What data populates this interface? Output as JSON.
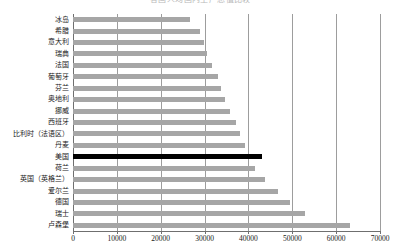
{
  "chart_data": {
    "type": "bar",
    "orientation": "horizontal",
    "title": "各国人均国内生产总值比较",
    "xlabel": "",
    "ylabel": "",
    "xlim": [
      0,
      70000
    ],
    "xticks": [
      0,
      10000,
      20000,
      30000,
      40000,
      50000,
      60000,
      70000
    ],
    "xtick_labels": [
      "0",
      "10000",
      "20000",
      "30000",
      "40000",
      "50000",
      "60000",
      "70000"
    ],
    "grid": true,
    "grid_axis": "x",
    "legend": null,
    "bar_color": "#a6a6a6",
    "highlight_color": "#000000",
    "highlight_category": "美国",
    "categories": [
      "冰岛",
      "希腊",
      "意大利",
      "瑞典",
      "法国",
      "葡萄牙",
      "芬兰",
      "奥地利",
      "挪威",
      "西班牙",
      "比利时（法语区）",
      "丹麦",
      "美国",
      "荷兰",
      "英国（英格兰）",
      "爱尔兰",
      "德国",
      "瑞士",
      "卢森堡"
    ],
    "values": [
      26600,
      29000,
      29800,
      30500,
      31700,
      33000,
      33700,
      34600,
      35800,
      37100,
      38000,
      39200,
      43000,
      41500,
      43700,
      46700,
      49400,
      52800,
      63100
    ]
  }
}
